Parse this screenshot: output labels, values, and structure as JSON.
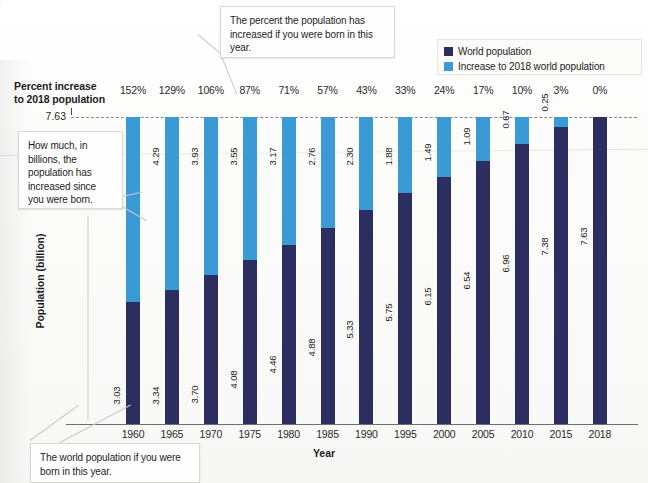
{
  "chart_data": {
    "type": "bar",
    "title": "",
    "xlabel": "Year",
    "ylabel": "Population (billion)",
    "ylim": [
      0,
      7.63
    ],
    "grid": false,
    "stacked": true,
    "reference_line": {
      "value": "7.63",
      "style": "dashed"
    },
    "categories": [
      "1960",
      "1965",
      "1970",
      "1975",
      "1980",
      "1985",
      "1990",
      "1995",
      "2000",
      "2005",
      "2010",
      "2015",
      "2018"
    ],
    "series": [
      {
        "name": "World population",
        "color": "#2b2e5e",
        "values": [
          3.03,
          3.34,
          3.7,
          4.08,
          4.46,
          4.88,
          5.33,
          5.75,
          6.15,
          6.54,
          6.96,
          7.38,
          7.63
        ],
        "labels": [
          "3.03",
          "3.34",
          "3.70",
          "4.08",
          "4.46",
          "4.88",
          "5.33",
          "5.75",
          "6.15",
          "6.54",
          "6.96",
          "7.38",
          "7.63"
        ]
      },
      {
        "name": "Increase to 2018 world population",
        "color": "#3a9ad5",
        "values": [
          4.6,
          4.29,
          3.93,
          3.55,
          3.17,
          2.76,
          2.3,
          1.88,
          1.49,
          1.09,
          0.67,
          0.25,
          0.0
        ],
        "labels": [
          "4.60",
          "4.29",
          "3.93",
          "3.55",
          "3.17",
          "2.76",
          "2.30",
          "1.88",
          "1.49",
          "1.09",
          "0.67",
          "0.25",
          ""
        ]
      }
    ],
    "percent_row": {
      "label": "Percent increase to 2018 population",
      "values": [
        "152%",
        "129%",
        "106%",
        "87%",
        "71%",
        "57%",
        "43%",
        "33%",
        "24%",
        "17%",
        "10%",
        "3%",
        "0%"
      ]
    },
    "annotations": [
      {
        "id": "callout-percent",
        "text": "The percent the population has increased if you were born in this year."
      },
      {
        "id": "callout-billions",
        "text": "How much, in billions, the population has increased since you were born."
      },
      {
        "id": "callout-world",
        "text": "The world population if you were born in this year."
      }
    ]
  },
  "header": {
    "percent_increase_line1": "Percent increase",
    "percent_increase_line2": "to 2018 population"
  },
  "legend": {
    "items": [
      {
        "label": "World population",
        "color": "#2b2e5e"
      },
      {
        "label": "Increase to 2018 world population",
        "color": "#3a9ad5"
      }
    ]
  },
  "axis": {
    "y_title": "Population (billion)",
    "x_title": "Year",
    "y_max_label": "7.63"
  },
  "callouts": {
    "percent": "The percent the population has increased if you were born in this year.",
    "billions": "How much, in billions, the population has increased since you were born.",
    "world": "The world population if you were born in this year."
  }
}
